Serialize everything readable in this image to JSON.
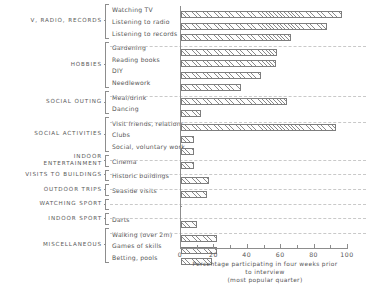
{
  "chart_data": {
    "type": "bar",
    "orientation": "horizontal",
    "title": "",
    "xlabel": "Percentage participating in four weeks prior to interview (most popular quarter)",
    "ylabel": "",
    "xlim": [
      0,
      100
    ],
    "xticks": [
      0,
      20,
      40,
      60,
      80,
      100
    ],
    "minor_ticks": [
      10,
      30,
      50,
      70,
      90
    ],
    "grid": false,
    "legend": "none",
    "categories": [
      "Watching TV",
      "Listening to radio",
      "Listening to records",
      "Gardening",
      "Reading books",
      "DIY",
      "Needlework",
      "Meal/drink",
      "Dancing",
      "Visit friends, relations",
      "Clubs",
      "Social, voluntary work",
      "Cinema",
      "Historic buildings",
      "Seaside visits",
      "",
      "Darts",
      "Walking (over 2m)",
      "Games of skills",
      "Betting, pools"
    ],
    "values": [
      97,
      88,
      66,
      58,
      57,
      48,
      36,
      64,
      12,
      93,
      8,
      8,
      8,
      17,
      16,
      1,
      10,
      22,
      22,
      19
    ],
    "groups": [
      {
        "label": "V, RADIO, RECORDS",
        "items": [
          0,
          1,
          2
        ]
      },
      {
        "label": "HOBBIES",
        "items": [
          3,
          4,
          5,
          6
        ]
      },
      {
        "label": "SOCIAL OUTING",
        "items": [
          7,
          8
        ]
      },
      {
        "label": "SOCIAL ACTIVITIES",
        "items": [
          9,
          10,
          11
        ]
      },
      {
        "label": "INDOOR\nENTERTAINMENT",
        "items": [
          12
        ]
      },
      {
        "label": "VISITS TO BUILDINGS",
        "items": [
          13
        ]
      },
      {
        "label": "OUTDOOR TRIPS",
        "items": [
          14
        ]
      },
      {
        "label": "WATCHING SPORT",
        "items": [
          15
        ]
      },
      {
        "label": "INDOOR SPORT",
        "items": [
          16
        ]
      },
      {
        "label": "MISCELLANEOUS",
        "items": [
          17,
          18,
          19
        ]
      }
    ]
  },
  "axis": {
    "caption_line1": "Percentage participating in four  weeks prior",
    "caption_line2": "to interview",
    "caption_line3": "(most popular quarter)",
    "tick_0": "0",
    "tick_20": "20",
    "tick_40": "40",
    "tick_60": "60",
    "tick_80": "80",
    "tick_100": "100"
  },
  "groups_text": {
    "g0": "V, RADIO, RECORDS",
    "g1": "HOBBIES",
    "g2": "SOCIAL OUTING",
    "g3": "SOCIAL ACTIVITIES",
    "g4": "INDOOR\nENTERTAINMENT",
    "g5": "VISITS TO BUILDINGS",
    "g6": "OUTDOOR TRIPS",
    "g7": "WATCHING SPORT",
    "g8": "INDOOR SPORT",
    "g9": "MISCELLANEOUS"
  },
  "items_text": {
    "i0": "Watching TV",
    "i1": "Listening to radio",
    "i2": "Listening to records",
    "i3": "Gardening",
    "i4": "Reading books",
    "i5": "DIY",
    "i6": "Needlework",
    "i7": "Meal/drink",
    "i8": "Dancing",
    "i9": "Visit friends, relations",
    "i10": "Clubs",
    "i11": "Social, voluntary work",
    "i12": "Cinema",
    "i13": "Historic buildings",
    "i14": "Seaside visits",
    "i15": "",
    "i16": "Darts",
    "i17": "Walking (over 2m)",
    "i18": "Games of skills",
    "i19": "Betting, pools"
  }
}
